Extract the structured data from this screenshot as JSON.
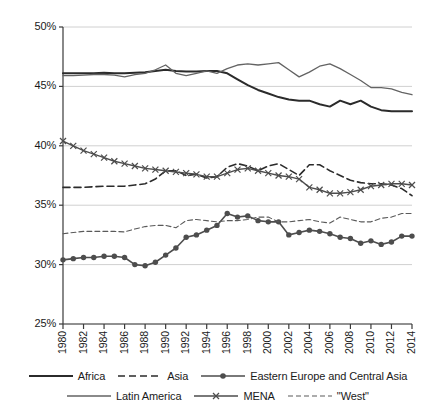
{
  "chart_data": {
    "type": "line",
    "title": "",
    "subtitle": "",
    "xlabel": "",
    "ylabel": "",
    "xlim": [
      1980,
      2014
    ],
    "ylim": [
      25,
      50
    ],
    "ytick_labels": [
      "50%",
      "45%",
      "40%",
      "35%",
      "30%",
      "25%"
    ],
    "ytick_values": [
      50,
      45,
      40,
      35,
      30,
      25
    ],
    "ytick_format": "percent",
    "xtick_labels": [
      "1980",
      "1982",
      "1984",
      "1986",
      "1988",
      "1990",
      "1992",
      "1994",
      "1996",
      "1998",
      "2000",
      "2002",
      "2004",
      "2006",
      "2008",
      "2010",
      "2012",
      "2014"
    ],
    "xtick_values": [
      1980,
      1982,
      1984,
      1986,
      1988,
      1990,
      1992,
      1994,
      1996,
      1998,
      2000,
      2002,
      2004,
      2006,
      2008,
      2010,
      2012,
      2014
    ],
    "x": [
      1980,
      1981,
      1982,
      1983,
      1984,
      1985,
      1986,
      1987,
      1988,
      1989,
      1990,
      1991,
      1992,
      1993,
      1994,
      1995,
      1996,
      1997,
      1998,
      1999,
      2000,
      2001,
      2002,
      2003,
      2004,
      2005,
      2006,
      2007,
      2008,
      2009,
      2010,
      2011,
      2012,
      2013,
      2014
    ],
    "grid": "horizontal",
    "legend_position": "below",
    "series": [
      {
        "name": "Africa",
        "style": "solid",
        "width": 2.0,
        "color": "#2b2b2b",
        "marker": "none",
        "values": [
          46.1,
          46.1,
          46.1,
          46.1,
          46.15,
          46.1,
          46.1,
          46.15,
          46.2,
          46.3,
          46.4,
          46.3,
          46.25,
          46.25,
          46.3,
          46.3,
          46.1,
          45.6,
          45.1,
          44.7,
          44.4,
          44.1,
          43.9,
          43.8,
          43.8,
          43.5,
          43.3,
          43.8,
          43.5,
          43.8,
          43.3,
          43.0,
          42.9,
          42.9,
          42.9
        ]
      },
      {
        "name": "Asia",
        "style": "dashed",
        "width": 1.6,
        "color": "#2b2b2b",
        "marker": "none",
        "values": [
          36.5,
          36.5,
          36.5,
          36.55,
          36.6,
          36.6,
          36.6,
          36.7,
          36.8,
          37.2,
          37.9,
          37.9,
          37.5,
          37.6,
          37.3,
          37.4,
          38.2,
          38.5,
          38.3,
          37.9,
          38.3,
          38.5,
          38.0,
          37.5,
          38.4,
          38.4,
          37.9,
          37.5,
          37.1,
          36.9,
          36.8,
          36.8,
          36.7,
          36.4,
          35.8
        ]
      },
      {
        "name": "Eastern Europe and Central Asia",
        "style": "solid",
        "width": 1.6,
        "color": "#4d4d4d",
        "marker": "circle",
        "values": [
          30.4,
          30.5,
          30.6,
          30.6,
          30.7,
          30.7,
          30.6,
          30.0,
          29.9,
          30.2,
          30.8,
          31.4,
          32.3,
          32.5,
          32.9,
          33.3,
          34.3,
          34.0,
          34.1,
          33.7,
          33.6,
          33.6,
          32.5,
          32.7,
          32.9,
          32.8,
          32.6,
          32.3,
          32.2,
          31.8,
          32.0,
          31.7,
          31.9,
          32.4,
          32.4
        ]
      },
      {
        "name": "Latin America",
        "style": "solid",
        "width": 1.3,
        "color": "#636363",
        "marker": "none",
        "values": [
          45.9,
          45.9,
          45.95,
          46.0,
          46.0,
          45.95,
          45.8,
          46.0,
          46.1,
          46.4,
          46.8,
          46.1,
          45.9,
          46.1,
          46.3,
          46.1,
          46.5,
          46.8,
          46.9,
          46.8,
          46.9,
          47.0,
          46.4,
          45.8,
          46.2,
          46.7,
          46.9,
          46.5,
          46.0,
          45.5,
          44.9,
          44.9,
          44.8,
          44.5,
          44.3
        ]
      },
      {
        "name": "MENA",
        "style": "solid",
        "width": 1.4,
        "color": "#4d4d4d",
        "marker": "x",
        "values": [
          40.4,
          40.0,
          39.6,
          39.3,
          39.0,
          38.7,
          38.5,
          38.3,
          38.1,
          38.0,
          37.9,
          37.8,
          37.7,
          37.6,
          37.4,
          37.4,
          37.7,
          38.0,
          38.1,
          37.9,
          37.7,
          37.5,
          37.4,
          37.2,
          36.5,
          36.3,
          36.0,
          36.0,
          36.1,
          36.3,
          36.6,
          36.7,
          36.8,
          36.8,
          36.7
        ]
      },
      {
        "name": "\"West\"",
        "style": "dashed-fine",
        "width": 1.1,
        "color": "#5a5a5a",
        "marker": "none",
        "values": [
          32.6,
          32.7,
          32.8,
          32.8,
          32.8,
          32.8,
          32.75,
          33.0,
          33.2,
          33.3,
          33.3,
          33.1,
          33.7,
          33.8,
          33.7,
          33.6,
          33.7,
          33.7,
          33.8,
          34.0,
          34.0,
          33.6,
          33.6,
          33.7,
          33.8,
          33.6,
          33.5,
          34.0,
          33.8,
          33.6,
          33.6,
          33.9,
          34.0,
          34.3,
          34.3
        ]
      }
    ]
  },
  "legend": {
    "rows": [
      [
        {
          "label": "Africa",
          "key": "africa"
        },
        {
          "label": "Asia",
          "key": "asia"
        },
        {
          "label": "Eastern Europe and Central Asia",
          "key": "eeca"
        }
      ],
      [
        {
          "label": "Latin America",
          "key": "latin-america"
        },
        {
          "label": "MENA",
          "key": "mena"
        },
        {
          "label": "\"West\"",
          "key": "west"
        }
      ]
    ]
  },
  "colors": {
    "africa": "#2b2b2b",
    "asia": "#2b2b2b",
    "eeca": "#4d4d4d",
    "latin_america": "#636363",
    "mena": "#4d4d4d",
    "west": "#5a5a5a",
    "grid": "#d0d0d0",
    "axis": "#3a3a3a"
  }
}
